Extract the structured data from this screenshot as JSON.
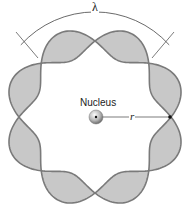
{
  "labels": {
    "nucleus": "Nucleus",
    "radius": "r",
    "wavelength": "λ"
  },
  "geometry": {
    "cx": 95,
    "cy": 117,
    "r": 76,
    "amplitude": 15,
    "nodes": 8
  },
  "colors": {
    "fill": "#c8c8c8",
    "stroke": "#7a7a7a",
    "arrow": "#444444"
  }
}
